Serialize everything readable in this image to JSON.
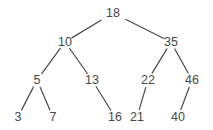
{
  "diagram": {
    "type": "binary-search-tree",
    "root": "18",
    "nodes": [
      {
        "id": "n18",
        "label": "18",
        "parent": null
      },
      {
        "id": "n10",
        "label": "10",
        "parent": "n18"
      },
      {
        "id": "n35",
        "label": "35",
        "parent": "n18"
      },
      {
        "id": "n5",
        "label": "5",
        "parent": "n10"
      },
      {
        "id": "n13",
        "label": "13",
        "parent": "n10"
      },
      {
        "id": "n22",
        "label": "22",
        "parent": "n35"
      },
      {
        "id": "n46",
        "label": "46",
        "parent": "n35"
      },
      {
        "id": "n3",
        "label": "3",
        "parent": "n5"
      },
      {
        "id": "n7",
        "label": "7",
        "parent": "n5"
      },
      {
        "id": "n16",
        "label": "16",
        "parent": "n13"
      },
      {
        "id": "n21",
        "label": "21",
        "parent": "n22"
      },
      {
        "id": "n40",
        "label": "40",
        "parent": "n46"
      }
    ],
    "edges": [
      {
        "from": "n18",
        "to": "n10"
      },
      {
        "from": "n18",
        "to": "n35"
      },
      {
        "from": "n10",
        "to": "n5"
      },
      {
        "from": "n10",
        "to": "n13"
      },
      {
        "from": "n35",
        "to": "n22"
      },
      {
        "from": "n35",
        "to": "n46"
      },
      {
        "from": "n5",
        "to": "n3"
      },
      {
        "from": "n5",
        "to": "n7"
      },
      {
        "from": "n13",
        "to": "n16"
      },
      {
        "from": "n22",
        "to": "n21"
      },
      {
        "from": "n46",
        "to": "n40"
      }
    ]
  }
}
